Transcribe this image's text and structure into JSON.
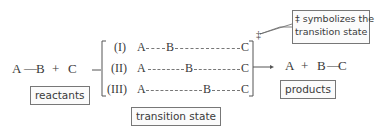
{
  "diagram": {
    "reactants": {
      "equation": [
        "A",
        "—",
        "B",
        "+",
        "C"
      ],
      "label": "reactants"
    },
    "transition_states": [
      {
        "numeral": "(I)",
        "atoms": [
          "A",
          "B",
          "C"
        ],
        "description": "B close to A"
      },
      {
        "numeral": "(II)",
        "atoms": [
          "A",
          "B",
          "C"
        ],
        "description": "B midway between A and C"
      },
      {
        "numeral": "(III)",
        "atoms": [
          "A",
          "B",
          "C"
        ],
        "description": "B close to C"
      }
    ],
    "transition_state_label": "transition state",
    "double_dagger": "‡",
    "callout": {
      "line1": "‡ symbolizes the",
      "line2": "transition state"
    },
    "products": {
      "equation": [
        "A",
        "+",
        "B",
        "—",
        "C"
      ],
      "label": "products"
    },
    "colors": {
      "text": "#3a3a3a",
      "box_border": "#777777"
    }
  }
}
